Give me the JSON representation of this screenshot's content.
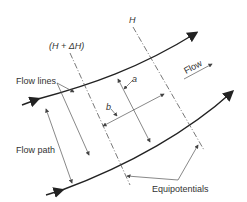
{
  "labels": {
    "h_plus_dh": "(H + ΔH)",
    "h": "H",
    "flow_lines": "Flow lines",
    "flow": "Flow",
    "a": "a",
    "b": "b",
    "flow_path": "Flow path",
    "equipotentials": "Equipotentials"
  },
  "colors": {
    "line": "#222222",
    "thin": "#555555",
    "text": "#333333"
  }
}
